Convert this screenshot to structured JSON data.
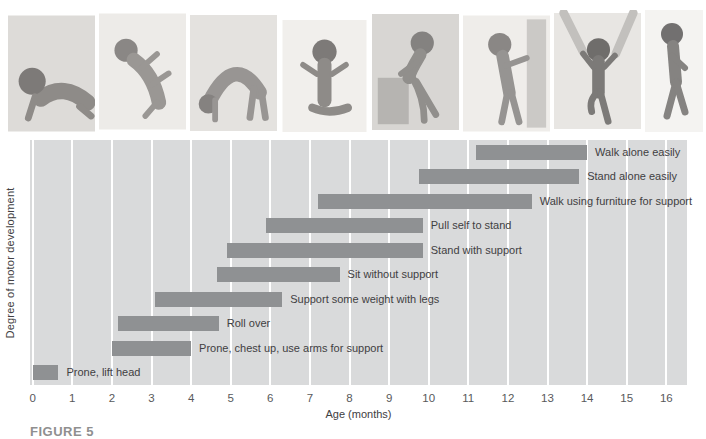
{
  "figure": {
    "caption": "FIGURE 5"
  },
  "photos": {
    "poses": [
      "prone-lift-head",
      "roll-over",
      "crawl-bottom-up",
      "sitting",
      "pull-to-stand",
      "stand-with-support",
      "walk-with-help",
      "walk-alone"
    ]
  },
  "chart_data": {
    "type": "bar",
    "orientation": "horizontal-range",
    "title": "",
    "xlabel": "Age (months)",
    "ylabel": "Degree of motor development",
    "xlim": [
      0,
      16
    ],
    "xticks": [
      "0",
      "1",
      "2",
      "3",
      "4",
      "5",
      "6",
      "7",
      "8",
      "9",
      "10",
      "11",
      "12",
      "13",
      "14",
      "15",
      "16"
    ],
    "grid": "vertical-white",
    "bars": [
      {
        "label": "Walk alone easily",
        "start": 11.2,
        "end": 14.0
      },
      {
        "label": "Stand alone easily",
        "start": 9.75,
        "end": 13.8
      },
      {
        "label": "Walk using furniture for support",
        "start": 7.2,
        "end": 12.6
      },
      {
        "label": "Pull self to stand",
        "start": 5.9,
        "end": 9.85
      },
      {
        "label": "Stand with support",
        "start": 4.9,
        "end": 9.85
      },
      {
        "label": "Sit without support",
        "start": 4.65,
        "end": 7.75
      },
      {
        "label": "Support some weight with legs",
        "start": 3.1,
        "end": 6.3
      },
      {
        "label": "Roll over",
        "start": 2.15,
        "end": 4.7
      },
      {
        "label": "Prone, chest up, use arms for support",
        "start": 2.0,
        "end": 4.0
      },
      {
        "label": "Prone, lift head",
        "start": 0.0,
        "end": 0.65
      }
    ],
    "colors": {
      "bar": "#8f9193",
      "plot_bg": "#d9dadb",
      "gridline": "#ffffff",
      "bar_label_text": "#414042",
      "tick_text": "#58595b",
      "axis_title_text": "#414042",
      "caption_text": "#8f8f8f"
    }
  }
}
